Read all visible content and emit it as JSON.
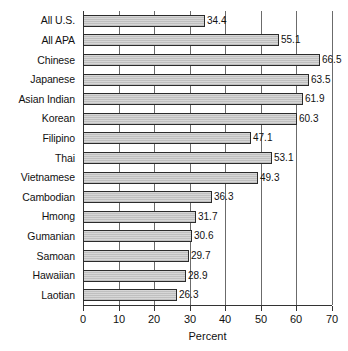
{
  "chart_data": {
    "type": "bar",
    "orientation": "horizontal",
    "title": "",
    "subtitle": "",
    "xlabel": "Percent",
    "ylabel": "",
    "xlim": [
      0,
      70
    ],
    "xticks": [
      0,
      10,
      20,
      30,
      40,
      50,
      60,
      70
    ],
    "xtick_labels": [
      "0",
      "10",
      "20",
      "30",
      "40",
      "50",
      "60",
      "70"
    ],
    "grid": "vertical",
    "legend": null,
    "legend_position": "none",
    "bar_fill_color": "#c9c9c9",
    "bar_border_color": "#2b2b2b",
    "gridline_color": "#6b6b6b",
    "axis_color": "#333333",
    "show_value_labels": true,
    "categories": [
      "All U.S.",
      "All APA",
      "Chinese",
      "Japanese",
      "Asian Indian",
      "Korean",
      "Filipino",
      "Thai",
      "Vietnamese",
      "Cambodian",
      "Hmong",
      "Gumanian",
      "Samoan",
      "Hawaiian",
      "Laotian"
    ],
    "values": [
      34.4,
      55.1,
      66.5,
      63.5,
      61.9,
      60.3,
      47.1,
      53.1,
      49.3,
      36.3,
      31.7,
      30.6,
      29.7,
      28.9,
      26.3
    ],
    "value_labels": [
      "34.4",
      "55.1",
      "66.5",
      "63.5",
      "61.9",
      "60.3",
      "47.1",
      "53.1",
      "49.3",
      "36.3",
      "31.7",
      "30.6",
      "29.7",
      "28.9",
      "26.3"
    ]
  }
}
